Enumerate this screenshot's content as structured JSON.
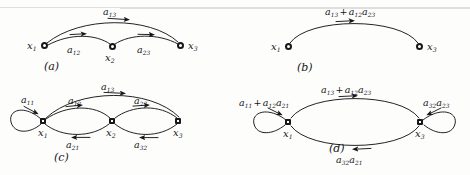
{
  "figure": {
    "background_color": "#fdfdfc",
    "ink_color": "#17171b",
    "width": 470,
    "height": 175
  },
  "panels": [
    {
      "id": "a",
      "caption": "(a)",
      "nodes": [
        {
          "id": "x1",
          "label_base": "x",
          "label_sub": "1"
        },
        {
          "id": "x2",
          "label_base": "x",
          "label_sub": "2"
        },
        {
          "id": "x3",
          "label_base": "x",
          "label_sub": "3"
        }
      ],
      "edges": [
        {
          "id": "a13",
          "from": "x1",
          "to": "x3",
          "label_base": "a",
          "label_sub": "13"
        },
        {
          "id": "a12",
          "from": "x1",
          "to": "x2",
          "label_base": "a",
          "label_sub": "12"
        },
        {
          "id": "a23",
          "from": "x2",
          "to": "x3",
          "label_base": "a",
          "label_sub": "23"
        }
      ]
    },
    {
      "id": "b",
      "caption": "(b)",
      "nodes": [
        {
          "id": "x1",
          "label_base": "x",
          "label_sub": "1"
        },
        {
          "id": "x3",
          "label_base": "x",
          "label_sub": "3"
        }
      ],
      "edges": [
        {
          "id": "combined",
          "from": "x1",
          "to": "x3",
          "terms": "a13 + a12a23"
        }
      ]
    },
    {
      "id": "c",
      "caption": "(c)",
      "nodes": [
        {
          "id": "x1",
          "label_base": "x",
          "label_sub": "1"
        },
        {
          "id": "x2",
          "label_base": "x",
          "label_sub": "2"
        },
        {
          "id": "x3",
          "label_base": "x",
          "label_sub": "3"
        }
      ],
      "edges": [
        {
          "id": "a11",
          "from": "x1",
          "to": "x1",
          "label_base": "a",
          "label_sub": "11",
          "self_loop": true
        },
        {
          "id": "a13",
          "from": "x1",
          "to": "x3",
          "label_base": "a",
          "label_sub": "13"
        },
        {
          "id": "a12",
          "from": "x1",
          "to": "x2",
          "label_base": "a",
          "label_sub": "12"
        },
        {
          "id": "a21",
          "from": "x2",
          "to": "x1",
          "label_base": "a",
          "label_sub": "21"
        },
        {
          "id": "a23",
          "from": "x2",
          "to": "x3",
          "label_base": "a",
          "label_sub": "23"
        },
        {
          "id": "a32",
          "from": "x3",
          "to": "x2",
          "label_base": "a",
          "label_sub": "32"
        }
      ]
    },
    {
      "id": "d",
      "caption": "(d)",
      "nodes": [
        {
          "id": "x1",
          "label_base": "x",
          "label_sub": "1"
        },
        {
          "id": "x3",
          "label_base": "x",
          "label_sub": "3"
        }
      ],
      "edges": [
        {
          "id": "loop1",
          "from": "x1",
          "to": "x1",
          "terms": "a11 + a12a21",
          "self_loop": true
        },
        {
          "id": "forward",
          "from": "x1",
          "to": "x3",
          "terms": "a13 + a12a23"
        },
        {
          "id": "backward",
          "from": "x3",
          "to": "x1",
          "terms": "a32a21"
        },
        {
          "id": "loop3",
          "from": "x3",
          "to": "x3",
          "terms": "a32a23",
          "self_loop": true
        }
      ]
    }
  ],
  "labels": {
    "a_a13": {
      "base": "a",
      "sub": "13"
    },
    "a_a12": {
      "base": "a",
      "sub": "12"
    },
    "a_a23": {
      "base": "a",
      "sub": "23"
    },
    "a_x1": {
      "base": "x",
      "sub": "1"
    },
    "a_x2": {
      "base": "x",
      "sub": "2"
    },
    "a_x3": {
      "base": "x",
      "sub": "3"
    },
    "a_caption": "(a)",
    "b_x1": {
      "base": "x",
      "sub": "1"
    },
    "b_x3": {
      "base": "x",
      "sub": "3"
    },
    "b_caption": "(b)",
    "c_a11": {
      "base": "a",
      "sub": "11"
    },
    "c_a13": {
      "base": "a",
      "sub": "13"
    },
    "c_a12": {
      "base": "a",
      "sub": "12"
    },
    "c_a21": {
      "base": "a",
      "sub": "21"
    },
    "c_a23": {
      "base": "a",
      "sub": "23"
    },
    "c_a32": {
      "base": "a",
      "sub": "32"
    },
    "c_x1": {
      "base": "x",
      "sub": "1"
    },
    "c_x2": {
      "base": "x",
      "sub": "2"
    },
    "c_x3": {
      "base": "x",
      "sub": "3"
    },
    "c_caption": "(c)",
    "d_x1": {
      "base": "x",
      "sub": "1"
    },
    "d_x3": {
      "base": "x",
      "sub": "3"
    },
    "d_caption": "(d)"
  }
}
